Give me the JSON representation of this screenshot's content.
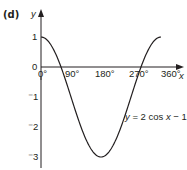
{
  "part_label": "(d)",
  "axis": {
    "x_label": "x",
    "y_label": "y",
    "origin_label": "0",
    "x_ticks": [
      "0°",
      "90°",
      "180°",
      "270°",
      "360°"
    ],
    "y_ticks": [
      "1",
      "⁻1",
      "⁻2",
      "⁻3"
    ]
  },
  "curve_label": "y = 2 cos x − 1",
  "chart_data": {
    "type": "line",
    "title": "",
    "xlabel": "x",
    "ylabel": "y",
    "equation": "y = 2cos x - 1",
    "x_ticks": [
      0,
      90,
      180,
      270,
      360
    ],
    "x_tick_labels": [
      "0°",
      "90°",
      "180°",
      "270°",
      "360°"
    ],
    "y_ticks": [
      1,
      0,
      -1,
      -2,
      -3
    ],
    "xlim": [
      0,
      360
    ],
    "ylim": [
      -3,
      1
    ],
    "grid": false,
    "series": [
      {
        "name": "y = 2cos x - 1",
        "x": [
          0,
          30,
          60,
          90,
          120,
          150,
          180,
          210,
          240,
          270,
          300,
          330,
          360
        ],
        "values": [
          1,
          0.73,
          0,
          -1,
          -2,
          -2.73,
          -3,
          -2.73,
          -2,
          -1,
          0,
          0.73,
          1
        ]
      }
    ],
    "annotations": [
      "y = 2cos x - 1"
    ]
  },
  "colors": {
    "ink": "#231f20",
    "background": "#ffffff"
  }
}
